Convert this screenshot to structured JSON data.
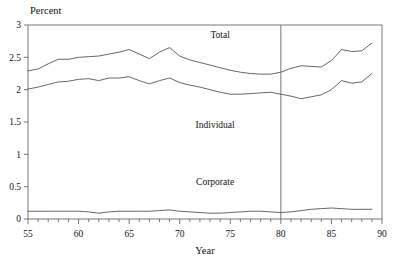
{
  "chart_data": {
    "type": "line",
    "title": "",
    "xlabel": "Year",
    "ylabel": "Percent",
    "xlim": [
      55,
      90
    ],
    "ylim": [
      0,
      3
    ],
    "xticks": [
      55,
      60,
      65,
      70,
      75,
      80,
      85,
      90
    ],
    "xticklabels": [
      "55",
      "60",
      "65",
      "70",
      "75",
      "80",
      "85",
      "90"
    ],
    "yticks": [
      0,
      0.5,
      1,
      1.5,
      2,
      2.5,
      3
    ],
    "yticklabels": [
      "0",
      "0.5",
      "1",
      "1.5",
      "2",
      "2.5",
      "3"
    ],
    "minor_xtick_interval": 1,
    "grid": false,
    "legend_position": "inline-annotations",
    "annotations": [
      {
        "text": "Total",
        "x": 74.0,
        "y": 2.8
      },
      {
        "text": "Individual",
        "x": 73.5,
        "y": 1.4
      },
      {
        "text": "Corporate",
        "x": 73.5,
        "y": 0.52
      }
    ],
    "reference_lines": [
      {
        "orientation": "vertical",
        "x": 80.0,
        "label": ""
      }
    ],
    "x": [
      55,
      56,
      57,
      58,
      59,
      60,
      61,
      62,
      63,
      64,
      65,
      66,
      67,
      68,
      69,
      70,
      71,
      72,
      73,
      74,
      75,
      76,
      77,
      78,
      79,
      80,
      81,
      82,
      83,
      84,
      85,
      86,
      87,
      88,
      89
    ],
    "series": [
      {
        "name": "Total",
        "values": [
          2.29,
          2.32,
          2.4,
          2.47,
          2.47,
          2.5,
          2.51,
          2.52,
          2.55,
          2.58,
          2.62,
          2.55,
          2.48,
          2.58,
          2.65,
          2.52,
          2.46,
          2.42,
          2.38,
          2.34,
          2.3,
          2.27,
          2.25,
          2.24,
          2.24,
          2.27,
          2.33,
          2.37,
          2.36,
          2.35,
          2.45,
          2.62,
          2.59,
          2.6,
          2.72
        ]
      },
      {
        "name": "Individual",
        "values": [
          2.01,
          2.04,
          2.08,
          2.12,
          2.13,
          2.16,
          2.17,
          2.14,
          2.18,
          2.18,
          2.2,
          2.14,
          2.09,
          2.14,
          2.18,
          2.11,
          2.07,
          2.04,
          2.0,
          1.96,
          1.93,
          1.93,
          1.94,
          1.95,
          1.96,
          1.93,
          1.9,
          1.86,
          1.89,
          1.92,
          2.0,
          2.14,
          2.1,
          2.12,
          2.25
        ]
      },
      {
        "name": "Corporate",
        "values": [
          0.12,
          0.12,
          0.12,
          0.12,
          0.12,
          0.12,
          0.11,
          0.09,
          0.11,
          0.12,
          0.12,
          0.12,
          0.12,
          0.13,
          0.14,
          0.12,
          0.11,
          0.1,
          0.09,
          0.09,
          0.1,
          0.11,
          0.12,
          0.12,
          0.11,
          0.1,
          0.11,
          0.13,
          0.15,
          0.16,
          0.17,
          0.16,
          0.15,
          0.15,
          0.15
        ]
      }
    ]
  },
  "axes": {
    "ylabel_text": "Percent",
    "xlabel_text": "Year"
  },
  "colors": {
    "line": "#555555",
    "frame": "#666666",
    "text": "#111111",
    "background": "#ffffff"
  }
}
